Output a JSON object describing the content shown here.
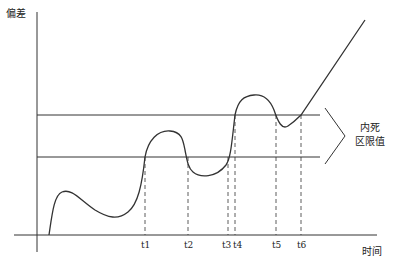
{
  "diagram": {
    "y_axis_label": "偏差",
    "x_axis_label": "时间",
    "threshold_label_line1": "内死",
    "threshold_label_line2": "区限值",
    "ticks": [
      {
        "label": "t1",
        "x": 145
      },
      {
        "label": "t2",
        "x": 188
      },
      {
        "label": "t3",
        "x": 228
      },
      {
        "label": "t4",
        "x": 236
      },
      {
        "label": "t5",
        "x": 276
      },
      {
        "label": "t6",
        "x": 301
      }
    ],
    "upper_threshold_y": 115,
    "lower_threshold_y": 157,
    "line_color": "#333333"
  }
}
